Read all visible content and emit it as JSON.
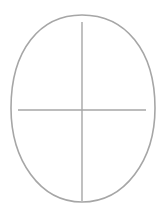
{
  "diagram": {
    "stroke_color": "#a6a6a6",
    "background": "#ffffff",
    "shapes": {
      "head_outline": "egg-shaped oval, wider at top",
      "vertical_guide": "center vertical line",
      "horizontal_guide": "eye-level horizontal line"
    }
  }
}
